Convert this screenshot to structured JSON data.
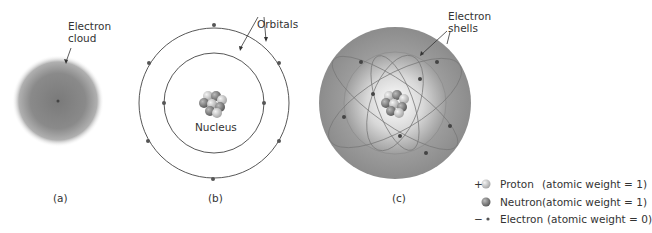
{
  "panels": {
    "a": {
      "caption": "(a)",
      "label_line1": "Electron",
      "label_line2": "cloud"
    },
    "b": {
      "caption": "(b)",
      "orbitals_label": "Orbitals",
      "nucleus_label": "Nucleus"
    },
    "c": {
      "caption": "(c)",
      "label_line1": "Electron",
      "label_line2": "shells"
    }
  },
  "legend": [
    {
      "sign": "+",
      "name": "Proton",
      "weight": "(atomic weight = 1)"
    },
    {
      "sign": "",
      "name": "Neutron",
      "weight": "(atomic weight = 1)"
    },
    {
      "sign": "−",
      "name": "Electron",
      "weight": "(atomic weight = 0)"
    }
  ]
}
